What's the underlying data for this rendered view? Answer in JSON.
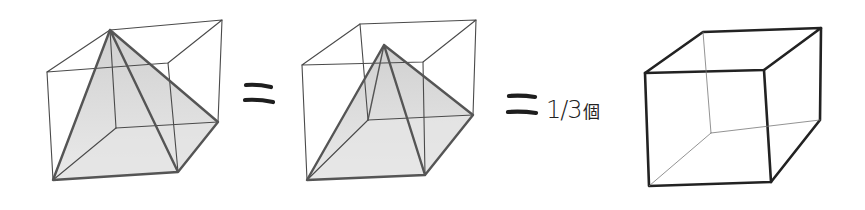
{
  "figure": {
    "equals_sign": "=",
    "fraction_text": "1/3",
    "unit_text": "個",
    "colors": {
      "background": "#ffffff",
      "line": "#4a4a4a",
      "pyramid_fill": "#d9d9d9",
      "cube_bold": "#222222"
    }
  },
  "panels": [
    {
      "name": "cube-with-pyramid-apex-at-corner"
    },
    {
      "name": "cube-with-pyramid-apex-at-center"
    },
    {
      "name": "empty-cube"
    }
  ]
}
